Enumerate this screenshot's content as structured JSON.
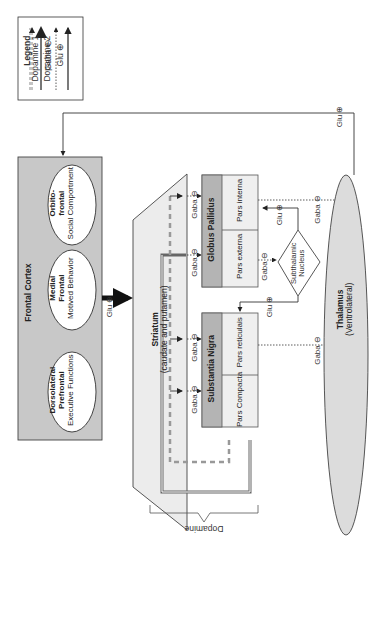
{
  "legend": {
    "title": "Legend",
    "items": [
      {
        "label": "Dopamine 1",
        "style": "dashed-double"
      },
      {
        "label": "Dopamine 2",
        "style": "solid-double"
      },
      {
        "label": "Gaba ⊖",
        "style": "dotted"
      },
      {
        "label": "Glu ⊕",
        "style": "solid"
      }
    ]
  },
  "frontal_cortex": {
    "title": "Frontal Cortex",
    "regions": [
      {
        "name": "Orbito-",
        "name2": "frontal",
        "role": "Social Comportment"
      },
      {
        "name": "Medial",
        "name2": "Frontal",
        "role": "Motived Behavior"
      },
      {
        "name": "Dorsolateral",
        "name2": "Prefrontal",
        "role": "Executive Functions"
      }
    ]
  },
  "striatum": {
    "title": "Striatum",
    "subtitle": "(caudate and putamen)"
  },
  "globus_pallidus": {
    "title": "Globus Pallidus",
    "interna": "Pars interna",
    "externa": "Pars externa"
  },
  "substantia_nigra": {
    "title": "Substantia Nigra",
    "reticulata": "Pars reticulais",
    "compacta": "Pars Compacta"
  },
  "subthalamic": {
    "line1": "Subthalamic",
    "line2": "Nucleus"
  },
  "thalamus": {
    "title": "Thalamus",
    "subtitle": "(Ventrolateral)"
  },
  "labels": {
    "glu": "Glu ⊕",
    "gaba": "Gaba ⊖",
    "dopamine": "Dopamine"
  },
  "colors": {
    "box_gray": "#c8c8c8",
    "header_gray": "#b4b4b4",
    "light": "#efefef",
    "line": "#333333"
  }
}
